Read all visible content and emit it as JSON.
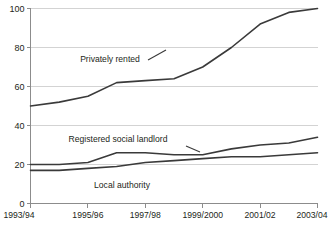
{
  "chart_data": {
    "type": "line",
    "title": "",
    "subtitle": "",
    "xlabel": "",
    "ylabel": "",
    "ylim": [
      0,
      100
    ],
    "yticks": [
      0,
      20,
      40,
      60,
      80,
      100
    ],
    "ytick_labels": [
      "0",
      "20",
      "40",
      "60",
      "80",
      "100"
    ],
    "grid": true,
    "legend_position": "inline-annotations",
    "x": [
      "1993/94",
      "1994/95",
      "1995/96",
      "1996/97",
      "1997/98",
      "1998/99",
      "1999/2000",
      "2000/01",
      "2001/02",
      "2002/03",
      "2003/04"
    ],
    "xtick_labels": [
      "1993/94",
      "1995/96",
      "1997/98",
      "1999/2000",
      "2001/02",
      "2003/04"
    ],
    "xtick_indices": [
      0,
      2,
      4,
      6,
      8,
      10
    ],
    "series": [
      {
        "name": "Privately rented",
        "color": "#3a3a3a",
        "values": [
          50,
          52,
          55,
          62,
          63,
          64,
          70,
          80,
          92,
          98,
          100
        ],
        "label": "Privately rented",
        "label_x": 110,
        "label_y": 62
      },
      {
        "name": "Registered social landlord",
        "color": "#3a3a3a",
        "values": [
          20,
          20,
          21,
          26,
          26,
          25,
          25,
          28,
          30,
          31,
          34
        ],
        "label": "Registered social landlord",
        "label_x": 118,
        "label_y": 142
      },
      {
        "name": "Local authority",
        "color": "#3a3a3a",
        "values": [
          17,
          17,
          18,
          19,
          21,
          22,
          23,
          24,
          24,
          25,
          26
        ],
        "label": "Local authority",
        "label_x": 122,
        "label_y": 188
      }
    ]
  }
}
